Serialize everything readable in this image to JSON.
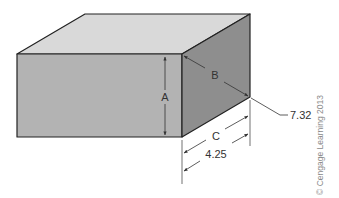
{
  "figure": {
    "type": "isometric-box-with-dimensions",
    "colors": {
      "top_face": "#d9d9d9",
      "front_face": "#b3b3b3",
      "right_face": "#8e8e8e",
      "edge": "#222222",
      "dimension_line": "#333333",
      "background": "#ffffff"
    }
  },
  "labels": {
    "A": "A",
    "B": "B",
    "C": "C",
    "diagonal_value": "7.32",
    "depth_value": "4.25"
  },
  "copyright": "© Cengage Learning 2013"
}
